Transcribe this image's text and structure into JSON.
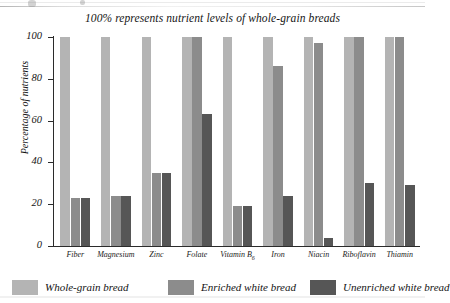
{
  "chart_data": {
    "type": "bar",
    "title": "100% represents nutrient levels of whole-grain breads",
    "xlabel": "",
    "ylabel": "Percentage of nutrients",
    "ylim": [
      0,
      100
    ],
    "yticks": [
      0,
      20,
      40,
      60,
      80,
      100
    ],
    "grid": false,
    "legend_position": "bottom",
    "categories": [
      "Fiber",
      "Magnesium",
      "Zinc",
      "Folate",
      "Vitamin B6",
      "Iron",
      "Niacin",
      "Riboflavin",
      "Thiamin"
    ],
    "series": [
      {
        "name": "Whole-grain bread",
        "color": "#b4b4b4",
        "values": [
          100,
          100,
          100,
          100,
          100,
          100,
          100,
          100,
          100
        ]
      },
      {
        "name": "Enriched white bread",
        "color": "#8c8c8c",
        "values": [
          23,
          24,
          35,
          100,
          19,
          86,
          97,
          100,
          100
        ]
      },
      {
        "name": "Unenriched white bread",
        "color": "#565656",
        "values": [
          23,
          24,
          35,
          63,
          19,
          24,
          4,
          30,
          29
        ]
      }
    ]
  }
}
